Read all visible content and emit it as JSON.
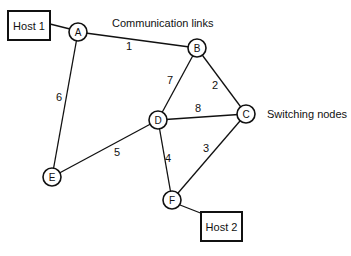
{
  "diagram": {
    "annotations": {
      "communication_links": "Communication links",
      "switching_nodes": "Switching nodes"
    },
    "hosts": [
      {
        "id": "host1",
        "label": "Host 1",
        "x": 8,
        "y": 11,
        "w": 42,
        "h": 29,
        "attached_to": "A"
      },
      {
        "id": "host2",
        "label": "Host 2",
        "x": 201,
        "y": 212,
        "w": 41,
        "h": 29,
        "attached_to": "F"
      }
    ],
    "nodes": [
      {
        "id": "A",
        "label": "A",
        "x": 78,
        "y": 32
      },
      {
        "id": "B",
        "label": "B",
        "x": 197,
        "y": 48
      },
      {
        "id": "C",
        "label": "C",
        "x": 246,
        "y": 114
      },
      {
        "id": "D",
        "label": "D",
        "x": 158,
        "y": 120
      },
      {
        "id": "E",
        "label": "E",
        "x": 52,
        "y": 177
      },
      {
        "id": "F",
        "label": "F",
        "x": 172,
        "y": 200
      }
    ],
    "links": [
      {
        "from": "A",
        "to": "B",
        "label": "1",
        "lx": 129,
        "ly": 46
      },
      {
        "from": "B",
        "to": "C",
        "label": "2",
        "lx": 215,
        "ly": 85
      },
      {
        "from": "C",
        "to": "F",
        "label": "3",
        "lx": 206,
        "ly": 148
      },
      {
        "from": "D",
        "to": "F",
        "label": "4",
        "lx": 168,
        "ly": 158
      },
      {
        "from": "E",
        "to": "D",
        "label": "5",
        "lx": 117,
        "ly": 152
      },
      {
        "from": "A",
        "to": "E",
        "label": "6",
        "lx": 59,
        "ly": 97
      },
      {
        "from": "B",
        "to": "D",
        "label": "7",
        "lx": 170,
        "ly": 80
      },
      {
        "from": "D",
        "to": "C",
        "label": "8",
        "lx": 198,
        "ly": 108
      }
    ]
  }
}
